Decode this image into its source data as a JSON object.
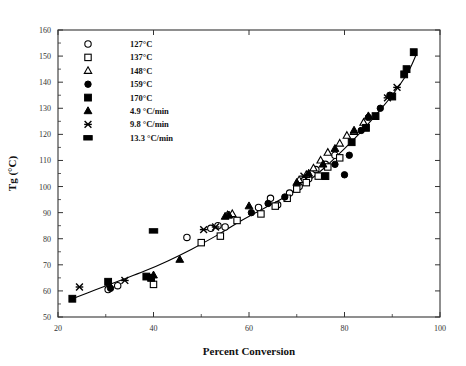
{
  "chart_data": {
    "type": "scatter",
    "title": "",
    "xlabel": "Percent Conversion",
    "ylabel": "Tg (°C)",
    "xlim": [
      20,
      100
    ],
    "ylim": [
      50,
      160
    ],
    "xticks": [
      20,
      40,
      60,
      80,
      100
    ],
    "xminorticks": [
      30,
      50,
      70,
      90
    ],
    "yticks": [
      50,
      60,
      70,
      80,
      90,
      100,
      110,
      120,
      130,
      140,
      150,
      160
    ],
    "grid": false,
    "legend_position": "upper-left-inside",
    "series": [
      {
        "name": "127°C",
        "marker": "open-circle",
        "points": [
          [
            30.5,
            60.5
          ],
          [
            32.5,
            62.0
          ],
          [
            47.0,
            80.5
          ],
          [
            52.0,
            84.0
          ],
          [
            53.5,
            85.0
          ],
          [
            55.0,
            84.5
          ],
          [
            62.0,
            92.0
          ],
          [
            64.5,
            95.5
          ],
          [
            66.0,
            93.0
          ],
          [
            68.5,
            97.5
          ],
          [
            70.5,
            100.0
          ],
          [
            72.5,
            103.0
          ],
          [
            74.0,
            106.5
          ],
          [
            76.0,
            108.5
          ],
          [
            78.0,
            112.0
          ]
        ]
      },
      {
        "name": "137°C",
        "marker": "open-square",
        "points": [
          [
            40.0,
            62.5
          ],
          [
            50.0,
            78.5
          ],
          [
            54.0,
            81.0
          ],
          [
            57.5,
            87.0
          ],
          [
            62.5,
            89.5
          ],
          [
            65.5,
            92.5
          ],
          [
            68.0,
            95.5
          ],
          [
            70.0,
            99.0
          ],
          [
            72.0,
            101.5
          ],
          [
            74.5,
            104.0
          ],
          [
            76.5,
            107.5
          ],
          [
            79.0,
            111.0
          ]
        ]
      },
      {
        "name": "148°C",
        "marker": "open-triangle",
        "points": [
          [
            55.5,
            89.0
          ],
          [
            56.5,
            89.5
          ],
          [
            70.5,
            102.5
          ],
          [
            72.0,
            104.5
          ],
          [
            73.5,
            107.0
          ],
          [
            75.0,
            110.0
          ],
          [
            76.5,
            113.0
          ],
          [
            79.0,
            116.5
          ],
          [
            80.5,
            119.5
          ],
          [
            82.0,
            121.0
          ],
          [
            84.0,
            124.5
          ]
        ]
      },
      {
        "name": "159°C",
        "marker": "filled-circle",
        "points": [
          [
            31.0,
            61.0
          ],
          [
            60.5,
            90.0
          ],
          [
            64.0,
            93.5
          ],
          [
            67.5,
            96.0
          ],
          [
            78.0,
            108.5
          ],
          [
            81.0,
            112.0
          ],
          [
            83.5,
            121.5
          ],
          [
            85.0,
            126.5
          ],
          [
            87.5,
            130.0
          ],
          [
            89.5,
            135.0
          ],
          [
            80.0,
            104.5
          ]
        ]
      },
      {
        "name": "170°C",
        "marker": "filled-square",
        "points": [
          [
            23.0,
            57.0
          ],
          [
            30.5,
            63.5
          ],
          [
            38.5,
            65.5
          ],
          [
            39.5,
            65.0
          ],
          [
            76.0,
            104.0
          ],
          [
            81.5,
            117.0
          ],
          [
            84.5,
            122.5
          ],
          [
            86.5,
            127.0
          ],
          [
            90.0,
            134.5
          ],
          [
            92.5,
            143.0
          ],
          [
            94.5,
            151.5
          ],
          [
            93.0,
            145.0
          ]
        ]
      },
      {
        "name": "4.9 °C/min",
        "marker": "filled-triangle",
        "points": [
          [
            40.0,
            66.0
          ],
          [
            45.5,
            72.0
          ],
          [
            55.0,
            88.5
          ],
          [
            55.8,
            89.0
          ],
          [
            60.0,
            92.5
          ],
          [
            70.0,
            101.5
          ],
          [
            72.5,
            105.0
          ],
          [
            75.5,
            108.5
          ],
          [
            78.0,
            114.5
          ],
          [
            82.0,
            121.5
          ],
          [
            85.0,
            127.0
          ]
        ]
      },
      {
        "name": "9.8 °C/min",
        "marker": "cross",
        "points": [
          [
            24.5,
            61.5
          ],
          [
            34.0,
            64.0
          ],
          [
            50.5,
            83.5
          ],
          [
            53.0,
            84.5
          ],
          [
            71.5,
            104.0
          ],
          [
            89.0,
            134.0
          ],
          [
            91.0,
            138.0
          ]
        ]
      },
      {
        "name": "13.3 °C/min",
        "marker": "filled-rect",
        "points": [
          [
            40.0,
            83.0
          ]
        ]
      }
    ],
    "trend_line": {
      "name": "fitted curve",
      "points": [
        [
          23.0,
          57.0
        ],
        [
          28.0,
          60.5
        ],
        [
          33.0,
          64.0
        ],
        [
          38.0,
          67.5
        ],
        [
          43.0,
          71.5
        ],
        [
          48.0,
          76.0
        ],
        [
          53.0,
          81.0
        ],
        [
          58.0,
          86.5
        ],
        [
          63.0,
          91.5
        ],
        [
          68.0,
          96.5
        ],
        [
          72.0,
          101.5
        ],
        [
          76.0,
          107.5
        ],
        [
          80.0,
          114.5
        ],
        [
          84.0,
          122.0
        ],
        [
          88.0,
          130.5
        ],
        [
          91.0,
          137.5
        ],
        [
          93.5,
          144.5
        ],
        [
          95.0,
          150.5
        ]
      ]
    }
  },
  "legend": {
    "entries": [
      {
        "label": "127°C",
        "marker": "open-circle"
      },
      {
        "label": "137°C",
        "marker": "open-square"
      },
      {
        "label": "148°C",
        "marker": "open-triangle"
      },
      {
        "label": "159°C",
        "marker": "filled-circle"
      },
      {
        "label": "170°C",
        "marker": "filled-square"
      },
      {
        "label": "4.9 °C/min",
        "marker": "filled-triangle"
      },
      {
        "label": "9.8 °C/min",
        "marker": "cross"
      },
      {
        "label": "13.3 °C/min",
        "marker": "filled-rect"
      }
    ]
  },
  "colors": {
    "ink": "#000000",
    "axis": "#333333",
    "background": "#ffffff"
  }
}
